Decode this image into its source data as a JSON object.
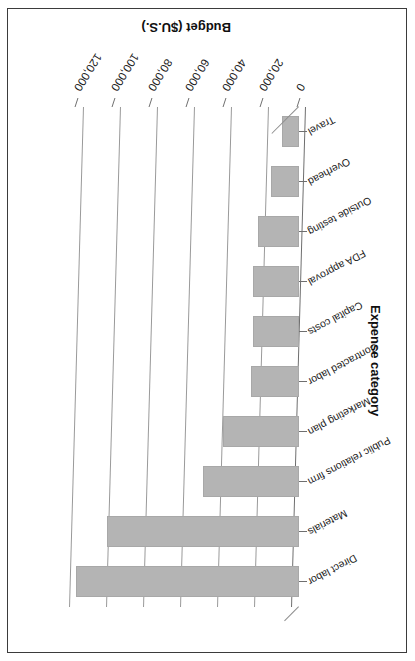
{
  "figure": {
    "orientation_note": "rotated-180",
    "frame_color": "#3b3b3b",
    "bar_color": "#b4b4b4",
    "gridline_color": "#9a9a9a",
    "background": "#ffffff"
  },
  "chart_data": {
    "type": "bar",
    "orientation": "horizontal",
    "title": "",
    "xlabel": "Budget ($U.S.)",
    "ylabel": "Expense category",
    "categories": [
      "Direct labor",
      "Materials",
      "Public relations firm",
      "Marketing plan",
      "Contracted labor",
      "Capital costs",
      "FDA approval",
      "Outside testing",
      "Overhead",
      "Travel"
    ],
    "values": [
      121000,
      104000,
      52000,
      41000,
      26000,
      25000,
      25000,
      22000,
      15000,
      9000
    ],
    "xlim": [
      0,
      130000
    ],
    "ticks": [
      0,
      20000,
      40000,
      60000,
      80000,
      100000,
      120000
    ],
    "tick_labels": [
      "0",
      "20,000",
      "40,000",
      "60,000",
      "80,000",
      "100,000",
      "120,000"
    ],
    "grid": true,
    "legend": false
  }
}
